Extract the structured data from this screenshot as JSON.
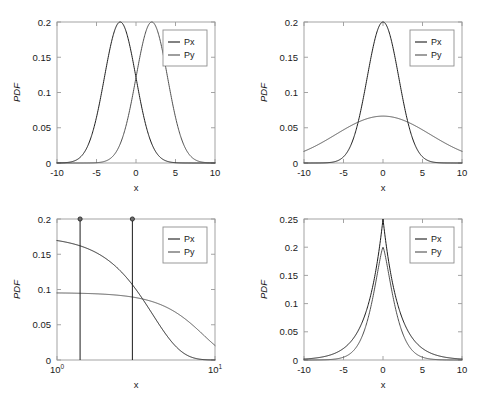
{
  "figure": {
    "background": "#ffffff",
    "panel_count": 4,
    "series_colors": {
      "Px": "#1c1c1c",
      "Py": "#4f4f4f"
    }
  },
  "chart_data": [
    {
      "id": "top-left",
      "type": "line",
      "title": "",
      "xlabel": "x",
      "ylabel": "PDF",
      "xlim": [
        -10,
        10
      ],
      "ylim": [
        0,
        0.2
      ],
      "xticks": [
        -10,
        -5,
        0,
        5,
        10
      ],
      "xticklabels": [
        "-10",
        "-5",
        "0",
        "5",
        "10"
      ],
      "yticks": [
        0,
        0.05,
        0.1,
        0.15,
        0.2
      ],
      "yticklabels": [
        "0",
        "0.05",
        "0.1",
        "0.15",
        "0.2"
      ],
      "xscale": "linear",
      "grid": false,
      "legend": {
        "position": "upper-right",
        "entries": [
          "Px",
          "Py"
        ]
      },
      "series": [
        {
          "name": "Px",
          "kind": "gaussian",
          "mean": -2.0,
          "sigma": 2.0,
          "peak": 0.2
        },
        {
          "name": "Py",
          "kind": "gaussian",
          "mean": 2.0,
          "sigma": 2.0,
          "peak": 0.2
        }
      ],
      "annotations": [
        "curves intersect at x=0, PDF=0.12"
      ]
    },
    {
      "id": "top-right",
      "type": "line",
      "title": "",
      "xlabel": "x",
      "ylabel": "PDF",
      "xlim": [
        -10,
        10
      ],
      "ylim": [
        0,
        0.2
      ],
      "xticks": [
        -10,
        -5,
        0,
        5,
        10
      ],
      "xticklabels": [
        "-10",
        "-5",
        "0",
        "5",
        "10"
      ],
      "yticks": [
        0,
        0.05,
        0.1,
        0.15,
        0.2
      ],
      "yticklabels": [
        "0",
        "0.05",
        "0.1",
        "0.15",
        "0.2"
      ],
      "xscale": "linear",
      "grid": false,
      "legend": {
        "position": "upper-right",
        "entries": [
          "Px",
          "Py"
        ]
      },
      "series": [
        {
          "name": "Px",
          "kind": "gaussian",
          "mean": 0.0,
          "sigma": 2.0,
          "peak": 0.2
        },
        {
          "name": "Py",
          "kind": "gaussian",
          "mean": 0.0,
          "sigma": 6.0,
          "peak": 0.0665
        }
      ],
      "annotations": [
        "wide curve reaches about 0.018 at x=-10 and x=10"
      ]
    },
    {
      "id": "bottom-left",
      "type": "line",
      "title": "",
      "xlabel": "x",
      "ylabel": "PDF",
      "xlim": [
        1,
        10
      ],
      "ylim": [
        0,
        0.2
      ],
      "xticks": [
        1,
        10
      ],
      "xticklabels": [
        "10^0",
        "10^1"
      ],
      "yticks": [
        0,
        0.05,
        0.1,
        0.15,
        0.2
      ],
      "yticklabels": [
        "0",
        "0.05",
        "0.1",
        "0.15",
        "0.2"
      ],
      "xscale": "log",
      "grid": false,
      "legend": {
        "position": "upper-right",
        "entries": [
          "Px",
          "Py"
        ]
      },
      "series": [
        {
          "name": "Px",
          "kind": "half-gaussian-decay",
          "start": 0.176,
          "scale": 3.0,
          "values_at": {
            "1": 0.176,
            "1.4": 0.1555,
            "3": 0.079,
            "5": 0.021,
            "7": 0.0035,
            "10": 0.0008
          }
        },
        {
          "name": "Py",
          "kind": "slow-decay",
          "start": 0.0955,
          "scale": 6.5,
          "values_at": {
            "1": 0.0955,
            "1.4": 0.0948,
            "3": 0.079,
            "5": 0.0545,
            "7": 0.0295,
            "10": 0.0055
          }
        }
      ],
      "markers": [
        {
          "x": 1.4,
          "y": 0.2,
          "vertical_line": true
        },
        {
          "x": 3.0,
          "y": 0.2,
          "vertical_line": true
        }
      ],
      "annotations": [
        "two vertical marker lines rising from the baseline to PDF=0.2, each capped with a round dot"
      ]
    },
    {
      "id": "bottom-right",
      "type": "line",
      "title": "",
      "xlabel": "x",
      "ylabel": "PDF",
      "xlim": [
        -10,
        10
      ],
      "ylim": [
        0,
        0.25
      ],
      "xticks": [
        -10,
        -5,
        0,
        5,
        10
      ],
      "xticklabels": [
        "-10",
        "-5",
        "0",
        "5",
        "10"
      ],
      "yticks": [
        0,
        0.05,
        0.1,
        0.15,
        0.2,
        0.25
      ],
      "yticklabels": [
        "0",
        "0.05",
        "0.1",
        "0.15",
        "0.2",
        "0.25"
      ],
      "xscale": "linear",
      "grid": false,
      "legend": {
        "position": "upper-right",
        "entries": [
          "Px",
          "Py"
        ]
      },
      "series": [
        {
          "name": "Px",
          "kind": "laplace",
          "mean": 0.0,
          "scale": 2.0,
          "peak": 0.25
        },
        {
          "name": "Py",
          "kind": "peaked-smooth",
          "mean": 0.0,
          "scale": 1.9,
          "peak": 0.2
        }
      ],
      "annotations": [
        "sharp cusp at x=0 reaching 0.25 over a rounded peak of 0.2"
      ]
    }
  ]
}
